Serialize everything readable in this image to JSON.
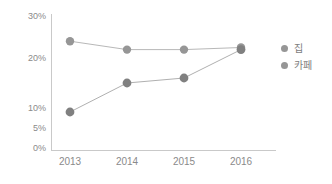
{
  "chart_data": {
    "type": "line",
    "title": "",
    "xlabel": "",
    "ylabel": "",
    "categories": [
      "2013",
      "2014",
      "2015",
      "2016"
    ],
    "x_tick_labels": [
      "2013",
      "2014",
      "2015",
      "2016"
    ],
    "y_tick_labels": [
      "0%",
      "5%",
      "10%",
      "20%",
      "30%"
    ],
    "y_tick_values": [
      0,
      5,
      10,
      20,
      30
    ],
    "ylim": [
      0,
      30
    ],
    "y_axis_scale": "irregular",
    "grid": false,
    "legend_position": "right",
    "series": [
      {
        "name": "집",
        "color": "#969696",
        "values": [
          24,
          22,
          22,
          22.5
        ]
      },
      {
        "name": "카페",
        "color": "#808080",
        "values": [
          9,
          15,
          16,
          22
        ]
      }
    ]
  },
  "axis": {
    "y_ticks": [
      {
        "label": "30%",
        "value": 30
      },
      {
        "label": "20%",
        "value": 20
      },
      {
        "label": "10%",
        "value": 10
      },
      {
        "label": "5%",
        "value": 5
      },
      {
        "label": "0%",
        "value": 0
      }
    ],
    "x_ticks": [
      {
        "label": "2013"
      },
      {
        "label": "2014"
      },
      {
        "label": "2015"
      },
      {
        "label": "2016"
      }
    ]
  },
  "legend": {
    "items": [
      {
        "label": "집",
        "color": "#969696"
      },
      {
        "label": "카페",
        "color": "#808080"
      }
    ]
  },
  "colors": {
    "axis": "#c9c9c9",
    "tick_text": "#8a8a8a",
    "series_home": "#969696",
    "series_cafe": "#808080",
    "line": "#b0b0b0",
    "background": "#ffffff"
  }
}
